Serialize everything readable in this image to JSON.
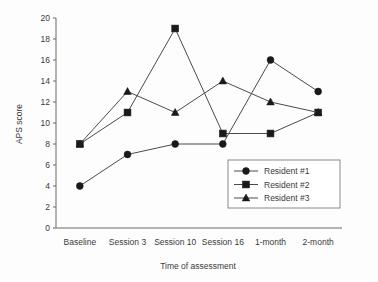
{
  "chart_data": {
    "type": "line",
    "title": "",
    "xlabel": "Time of assessment",
    "ylabel": "APS score",
    "categories": [
      "Baseline",
      "Session 3",
      "Session 10",
      "Session 16",
      "1-month",
      "2-month"
    ],
    "ylim": [
      0,
      20
    ],
    "ytick_step": 2,
    "yticks": [
      0,
      2,
      4,
      6,
      8,
      10,
      12,
      14,
      16,
      18,
      20
    ],
    "grid": false,
    "legend_position": "inside-bottom-right",
    "series": [
      {
        "name": "Resident #1",
        "marker": "circle",
        "values": [
          4,
          7,
          8,
          8,
          16,
          13
        ]
      },
      {
        "name": "Resident #2",
        "marker": "square",
        "values": [
          8,
          11,
          19,
          9,
          9,
          11
        ]
      },
      {
        "name": "Resident #3",
        "marker": "triangle",
        "values": [
          8,
          13,
          11,
          14,
          12,
          11
        ]
      }
    ],
    "colors": {
      "line": "#4a4a4a",
      "marker": "#1a1a1a",
      "axis": "#6b6b6b",
      "text": "#3a3a3a",
      "background": "#fdfdfd"
    }
  }
}
